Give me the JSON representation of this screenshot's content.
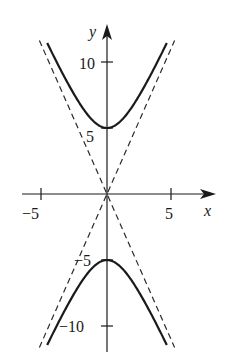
{
  "chart_data": {
    "type": "line",
    "title": "",
    "xlabel": "x",
    "ylabel": "y",
    "xlim": [
      -7.5,
      8.5
    ],
    "ylim": [
      -12.8,
      13
    ],
    "grid": false,
    "legend": null,
    "x_ticks": [
      -5,
      5
    ],
    "x_tick_labels": [
      "−5",
      "5"
    ],
    "y_ticks": [
      10,
      5,
      -5,
      -10
    ],
    "y_tick_labels": [
      "10",
      "5",
      "−5",
      "−10"
    ],
    "equation": "y^2/25 - x^2/5 = 1",
    "series": [
      {
        "name": "hyperbola upper branch",
        "style": "solid",
        "x": [
          -4.6,
          -4,
          -3,
          -2,
          -1,
          0,
          1,
          2,
          3,
          4,
          4.6
        ],
        "y": [
          11.3,
          10.25,
          8.37,
          6.71,
          5.48,
          5.0,
          5.48,
          6.71,
          8.37,
          10.25,
          11.3
        ]
      },
      {
        "name": "hyperbola lower branch",
        "style": "solid",
        "x": [
          -4.6,
          -4,
          -3,
          -2,
          -1,
          0,
          1,
          2,
          3,
          4,
          4.6
        ],
        "y": [
          -11.3,
          -10.25,
          -8.37,
          -6.71,
          -5.48,
          -5.0,
          -5.48,
          -6.71,
          -8.37,
          -10.25,
          -11.3
        ]
      },
      {
        "name": "asymptote y = √5 x",
        "style": "dashed",
        "x": [
          -5.2,
          5.2
        ],
        "y": [
          -11.63,
          11.63
        ]
      },
      {
        "name": "asymptote y = −√5 x",
        "style": "dashed",
        "x": [
          -5.2,
          5.2
        ],
        "y": [
          11.63,
          -11.63
        ]
      }
    ],
    "annotations": []
  },
  "labels": {
    "x_axis": "x",
    "y_axis": "y",
    "x_neg5": "−5",
    "x_pos5": "5",
    "y_10": "10",
    "y_5": "5",
    "y_neg5": "−5",
    "y_neg10": "−10"
  }
}
